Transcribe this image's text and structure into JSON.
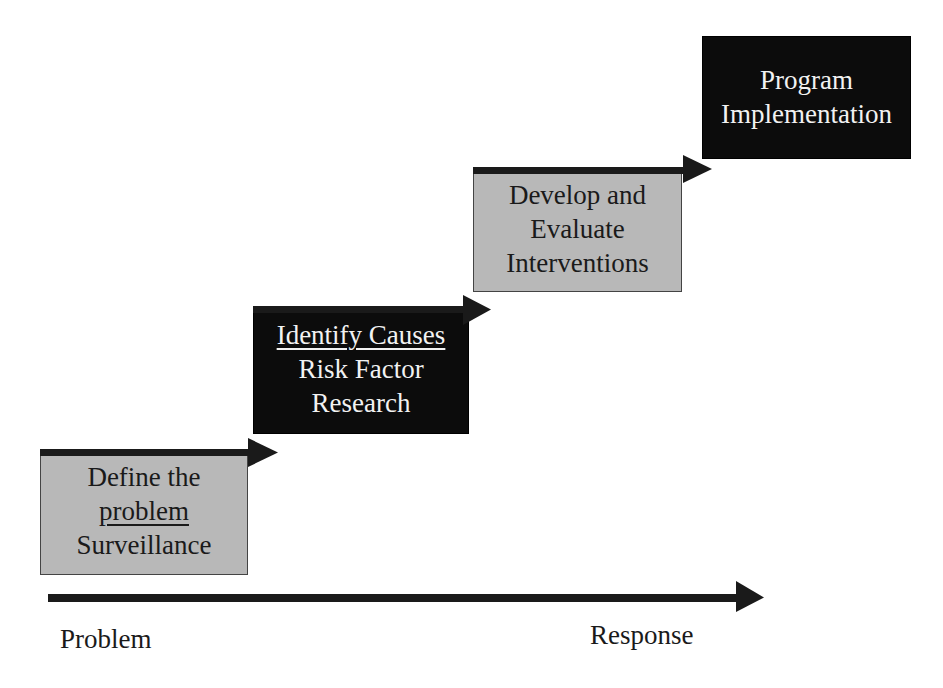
{
  "diagram": {
    "type": "staircase-process",
    "colors": {
      "gray_box": "#b8b8b8",
      "black_box": "#0c0c0c",
      "arrow": "#1a1a1a",
      "dark_text": "#1a1a1a",
      "light_text": "#f2f2f2"
    },
    "steps": [
      {
        "id": "define-problem",
        "style": "gray",
        "lines": [
          {
            "text": "Define the",
            "underline": false
          },
          {
            "text": "problem",
            "underline": true
          },
          {
            "text": "Surveillance",
            "underline": false
          }
        ]
      },
      {
        "id": "identify-causes",
        "style": "black",
        "lines": [
          {
            "text": "Identify Causes",
            "underline": true
          },
          {
            "text": "Risk Factor",
            "underline": false
          },
          {
            "text": "Research",
            "underline": false
          }
        ]
      },
      {
        "id": "develop-evaluate",
        "style": "gray",
        "lines": [
          {
            "text": "Develop and",
            "underline": false
          },
          {
            "text": "Evaluate",
            "underline": false
          },
          {
            "text": "Interventions",
            "underline": false
          }
        ]
      },
      {
        "id": "program-implementation",
        "style": "black",
        "lines": [
          {
            "text": "Program",
            "underline": false
          },
          {
            "text": "Implementation",
            "underline": false
          }
        ]
      }
    ],
    "axis": {
      "start_label": "Problem",
      "end_label": "Response",
      "direction": "left-to-right"
    }
  }
}
